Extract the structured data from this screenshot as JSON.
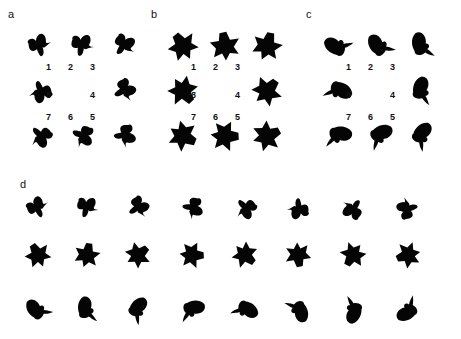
{
  "figure": {
    "panels": [
      {
        "id": "a",
        "label": "a",
        "shape_family": "bow",
        "position_labels": [
          "1",
          "2",
          "3",
          "4",
          "5",
          "6",
          "7",
          "8"
        ]
      },
      {
        "id": "b",
        "label": "b",
        "shape_family": "star",
        "position_labels": [
          "1",
          "2",
          "3",
          "4",
          "5",
          "6",
          "7",
          "8"
        ]
      },
      {
        "id": "c",
        "label": "c",
        "shape_family": "blob",
        "position_labels": [
          "1",
          "2",
          "3",
          "4",
          "5",
          "6",
          "7",
          "8"
        ]
      },
      {
        "id": "d",
        "label": "d",
        "rows": [
          {
            "shape_family": "bow",
            "count": 8
          },
          {
            "shape_family": "star",
            "count": 8
          },
          {
            "shape_family": "blob",
            "count": 8
          }
        ]
      }
    ],
    "ink_color": "#050505",
    "background_color": "#ffffff"
  }
}
